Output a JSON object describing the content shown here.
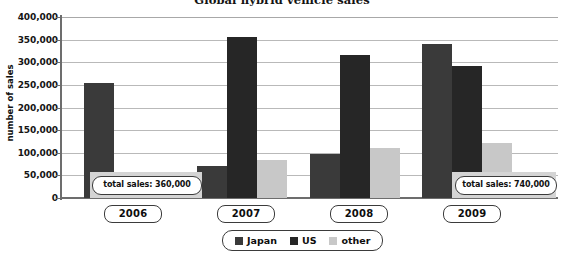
{
  "chart_data": {
    "type": "bar",
    "title": "Global hybrid vehicle sales",
    "xlabel": "",
    "ylabel": "number of sales",
    "ylim": [
      0,
      400000
    ],
    "yticks": [
      "0",
      "50,000",
      "100,000",
      "150,000",
      "200,000",
      "250,000",
      "300,000",
      "350,000",
      "400,000"
    ],
    "ytick_values": [
      0,
      50000,
      100000,
      150000,
      200000,
      250000,
      300000,
      350000,
      400000
    ],
    "grid": true,
    "legend_position": "bottom-center",
    "categories": [
      "2006",
      "2007",
      "2008",
      "2009"
    ],
    "series": [
      {
        "name": "Japan",
        "color": "#3a3a3a",
        "values": [
          255000,
          70000,
          98000,
          340000
        ]
      },
      {
        "name": "US",
        "color": "#262626",
        "values": [
          0,
          355000,
          315000,
          292000
        ]
      },
      {
        "name": "other",
        "color": "#c8c8c8",
        "values": [
          0,
          85000,
          110000,
          122000
        ]
      }
    ],
    "annotations": [
      {
        "category": "2006",
        "text": "total sales: 360,000"
      },
      {
        "category": "2009",
        "text": "total sales: 740,000"
      }
    ]
  },
  "legend": {
    "items": [
      {
        "label": "Japan"
      },
      {
        "label": "US"
      },
      {
        "label": "other"
      }
    ]
  }
}
